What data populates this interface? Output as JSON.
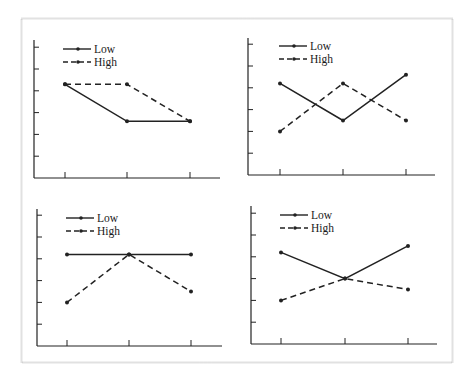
{
  "figure": {
    "frame_color": "#c8c8c8",
    "ink_color": "#222222"
  },
  "legend": {
    "low_label": "Low",
    "high_label": "High"
  },
  "chart_data": [
    {
      "type": "line",
      "panel": "top-left",
      "categories": [
        "1",
        "2",
        "3"
      ],
      "series": [
        {
          "name": "Low",
          "style": "solid",
          "values": [
            4.3,
            2.6,
            2.6
          ]
        },
        {
          "name": "High",
          "style": "dashed",
          "values": [
            4.3,
            4.3,
            2.6
          ]
        }
      ],
      "title": "",
      "xlabel": "",
      "ylabel": "",
      "ylim": [
        0,
        6
      ],
      "yticks": 6,
      "grid": false,
      "legend_position": "upper-left"
    },
    {
      "type": "line",
      "panel": "top-right",
      "categories": [
        "1",
        "2",
        "3"
      ],
      "series": [
        {
          "name": "Low",
          "style": "solid",
          "values": [
            4.2,
            2.5,
            4.6
          ]
        },
        {
          "name": "High",
          "style": "dashed",
          "values": [
            2.0,
            4.2,
            2.5
          ]
        }
      ],
      "title": "",
      "xlabel": "",
      "ylabel": "",
      "ylim": [
        0,
        6
      ],
      "yticks": 6,
      "grid": false,
      "legend_position": "upper-left"
    },
    {
      "type": "line",
      "panel": "bottom-left",
      "categories": [
        "1",
        "2",
        "3"
      ],
      "series": [
        {
          "name": "Low",
          "style": "solid",
          "values": [
            4.2,
            4.2,
            4.2
          ]
        },
        {
          "name": "High",
          "style": "dashed",
          "values": [
            2.0,
            4.2,
            2.5
          ]
        }
      ],
      "title": "",
      "xlabel": "",
      "ylabel": "",
      "ylim": [
        0,
        6
      ],
      "yticks": 6,
      "grid": false,
      "legend_position": "upper-left"
    },
    {
      "type": "line",
      "panel": "bottom-right",
      "categories": [
        "1",
        "2",
        "3"
      ],
      "series": [
        {
          "name": "Low",
          "style": "solid",
          "values": [
            4.2,
            3.0,
            4.5
          ]
        },
        {
          "name": "High",
          "style": "dashed",
          "values": [
            2.0,
            3.0,
            2.5
          ]
        }
      ],
      "title": "",
      "xlabel": "",
      "ylabel": "",
      "ylim": [
        0,
        6
      ],
      "yticks": 6,
      "grid": false,
      "legend_position": "upper-left"
    }
  ]
}
